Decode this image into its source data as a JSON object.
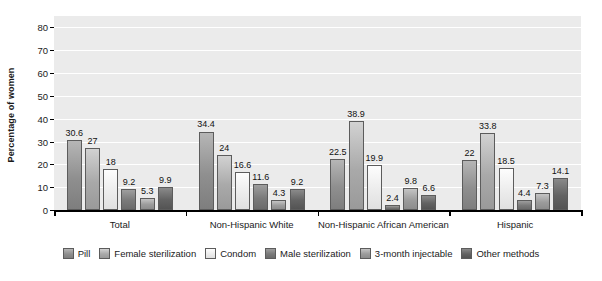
{
  "chart_data": {
    "type": "bar",
    "title": "",
    "xlabel": "",
    "ylabel": "Percentage of women",
    "ylim": [
      0,
      85
    ],
    "yticks": [
      0,
      10,
      20,
      30,
      40,
      50,
      60,
      70,
      80
    ],
    "grid": true,
    "legend_position": "bottom",
    "categories": [
      "Total",
      "Non-Hispanic White",
      "Non-Hispanic African American",
      "Hispanic"
    ],
    "series": [
      {
        "name": "Pill",
        "color": "#8f8f8f",
        "values": [
          30.6,
          34.4,
          22.5,
          22.0
        ]
      },
      {
        "name": "Female sterilization",
        "color": "#a9a9a9",
        "values": [
          27.0,
          24.0,
          38.9,
          33.8
        ]
      },
      {
        "name": "Condom",
        "color": "#ececec",
        "values": [
          18.0,
          16.6,
          19.9,
          18.5
        ]
      },
      {
        "name": "Male sterilization",
        "color": "#7a7a7a",
        "values": [
          9.2,
          11.6,
          2.4,
          4.4
        ]
      },
      {
        "name": "3-month injectable",
        "color": "#9c9c9c",
        "values": [
          5.3,
          4.3,
          9.8,
          7.3
        ]
      },
      {
        "name": "Other methods",
        "color": "#636363",
        "values": [
          9.9,
          9.2,
          6.6,
          14.1
        ]
      }
    ],
    "data_labels": [
      [
        "30.6",
        "27",
        "18",
        "9.2",
        "5.3",
        "9.9"
      ],
      [
        "34.4",
        "24",
        "16.6",
        "11.6",
        "4.3",
        "9.2"
      ],
      [
        "22.5",
        "38.9",
        "19.9",
        "2.4",
        "9.8",
        "6.6"
      ],
      [
        "22",
        "33.8",
        "18.5",
        "4.4",
        "7.3",
        "14.1"
      ]
    ]
  },
  "axis": {
    "y_title": "Percentage of women",
    "y_tick_labels": [
      "80",
      "70",
      "60",
      "50",
      "40",
      "30",
      "20",
      "10",
      "0"
    ]
  },
  "legend": {
    "items": [
      {
        "label": "Pill"
      },
      {
        "label": "Female sterilization"
      },
      {
        "label": "Condom"
      },
      {
        "label": "Male sterilization"
      },
      {
        "label": "3-month injectable"
      },
      {
        "label": "Other methods"
      }
    ]
  }
}
